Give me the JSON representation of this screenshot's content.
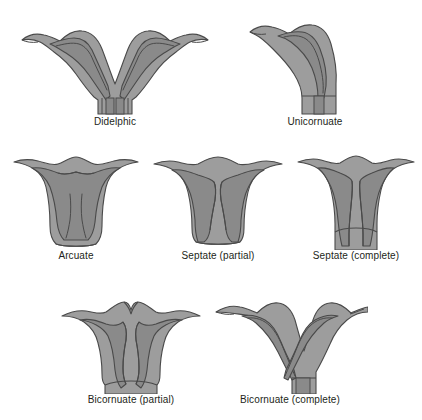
{
  "figure": {
    "background_color": "#ffffff",
    "colors": {
      "myometrium_fill": "#9d9d9d",
      "cavity_fill": "#8a8a8a",
      "outline": "#4a4a4a",
      "label_text": "#231f20"
    }
  },
  "diagrams": [
    {
      "id": "didelphic",
      "label": "Didelphic",
      "row": 1,
      "column": 1,
      "description": "Two complete uterine horns with two cervices and a vaginal septum"
    },
    {
      "id": "unicornuate",
      "label": "Unicornuate",
      "row": 1,
      "column": 2,
      "description": "Single banana-shaped uterine horn deviated to one side with one cervix"
    },
    {
      "id": "arcuate",
      "label": "Arcuate",
      "row": 2,
      "column": 1,
      "description": "Normal outer contour with a shallow concave fundal indentation of the cavity"
    },
    {
      "id": "septate-partial",
      "label": "Septate (partial)",
      "row": 2,
      "column": 2,
      "description": "Normal fundal contour with a septum partially dividing the endometrial cavity"
    },
    {
      "id": "septate-complete",
      "label": "Septate (complete)",
      "row": 2,
      "column": 3,
      "description": "Normal fundal contour with a septum extending to the cervix"
    },
    {
      "id": "bicornuate-partial",
      "label": "Bicornuate (partial)",
      "row": 3,
      "column": 1,
      "description": "Fundal cleft of the outer contour with two partially separated horns and one cervix"
    },
    {
      "id": "bicornuate-complete",
      "label": "Bicornuate (complete)",
      "row": 3,
      "column": 2,
      "description": "Deep fundal cleft with two widely divergent horns joining at a single cervix"
    }
  ]
}
